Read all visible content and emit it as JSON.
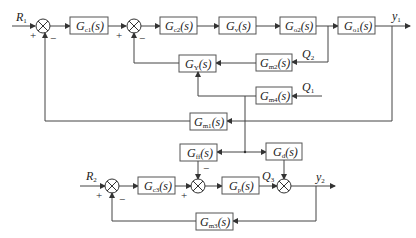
{
  "diagram": {
    "type": "block-diagram",
    "inputs": {
      "r1": "R",
      "r1_sub": "1",
      "r2": "R",
      "r2_sub": "2"
    },
    "outputs": {
      "y1": "y",
      "y1_sub": "1",
      "y2": "y",
      "y2_sub": "2"
    },
    "disturbances": {
      "q1": "Q",
      "q1_sub": "1",
      "q2": "Q",
      "q2_sub": "2",
      "q3": "Q",
      "q3_sub": "3"
    },
    "signs": {
      "plus": "+",
      "minus": "−"
    },
    "blocks": {
      "gc1": {
        "main": "G",
        "sub": "c1",
        "arg": "(s)"
      },
      "gc2": {
        "main": "G",
        "sub": "c2",
        "arg": "(s)"
      },
      "gv": {
        "main": "G",
        "sub": "v",
        "arg": "(s)"
      },
      "go2": {
        "main": "G",
        "sub": "o2",
        "arg": "(s)"
      },
      "go1": {
        "main": "G",
        "sub": "o1",
        "arg": "(s)"
      },
      "gy": {
        "main": "G",
        "sub": "Y",
        "arg": "(s)"
      },
      "gm2": {
        "main": "G",
        "sub": "m2",
        "arg": "(s)"
      },
      "gm4": {
        "main": "G",
        "sub": "m4",
        "arg": "(s)"
      },
      "gm1": {
        "main": "G",
        "sub": "m1",
        "arg": "(s)"
      },
      "gff": {
        "main": "G",
        "sub": "ff",
        "arg": "(s)"
      },
      "gd": {
        "main": "G",
        "sub": "d",
        "arg": "(s)"
      },
      "gc3": {
        "main": "G",
        "sub": "c3",
        "arg": "(s)"
      },
      "gp": {
        "main": "G",
        "sub": "p",
        "arg": "(s)"
      },
      "gm3": {
        "main": "G",
        "sub": "m3",
        "arg": "(s)"
      }
    },
    "connections": [
      "R1 -> sum1(+)",
      "sum1 -> Gc1",
      "Gc1 -> sum2(+)",
      "sum2 -> Gc2",
      "Gc2 -> Gv",
      "Gv -> Go2",
      "Go2 -> Go1",
      "Go1 -> y1",
      "Go2 out (Q2) -> Gm2",
      "Gm2 -> GY",
      "Q1 -> Gm4",
      "Gm4 -> GY",
      "GY -> sum2(-)",
      "y1 -> Gm1",
      "Gm1 -> sum1(-)",
      "Gm4 -> Gff",
      "Gm4 -> Gd",
      "R2 -> sum3(+)",
      "sum3 -> Gc3",
      "Gc3 -> sum4(+)",
      "Gff -> sum4(-)",
      "sum4 -> Gp",
      "Gp (Q3) -> sum5",
      "Gd -> sum5",
      "sum5 -> y2",
      "y2 -> Gm3",
      "Gm3 -> sum3(-)"
    ]
  }
}
